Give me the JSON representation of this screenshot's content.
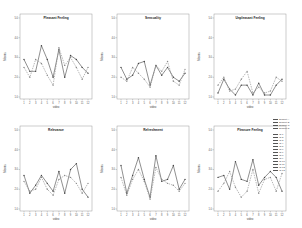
{
  "chart_data": [
    {
      "type": "line",
      "title": "Pleasant Feeling",
      "xlabel": "video",
      "ylabel": "Means",
      "ylim": [
        1.0,
        5.0
      ],
      "yticks": [
        "1.0",
        "2.0",
        "3.0",
        "4.0",
        "5.0"
      ],
      "x": [
        "1",
        "2",
        "3",
        "4",
        "5",
        "6",
        "7",
        "8",
        "9",
        "10",
        "11",
        "12"
      ],
      "series": [
        {
          "name": "Series A",
          "style": "solid",
          "values": [
            2.9,
            2.3,
            2.3,
            3.6,
            2.9,
            2.0,
            3.4,
            2.0,
            3.1,
            2.9,
            2.5,
            2.2
          ]
        },
        {
          "name": "Series B",
          "style": "dashed",
          "values": [
            2.5,
            2.0,
            2.9,
            2.7,
            2.1,
            1.6,
            3.5,
            2.6,
            3.0,
            2.5,
            1.9,
            2.5
          ]
        }
      ]
    },
    {
      "type": "line",
      "title": "Sensuality",
      "xlabel": "video",
      "ylabel": "Means",
      "ylim": [
        1.0,
        5.0
      ],
      "yticks": [
        "1.0",
        "2.0",
        "3.0",
        "4.0",
        "5.0"
      ],
      "x": [
        "1",
        "2",
        "3",
        "4",
        "5",
        "6",
        "7",
        "8",
        "9",
        "10",
        "11",
        "12"
      ],
      "series": [
        {
          "name": "Series A",
          "style": "solid",
          "values": [
            2.5,
            1.9,
            2.1,
            2.7,
            2.8,
            1.6,
            2.6,
            2.1,
            2.5,
            2.0,
            1.8,
            2.2
          ]
        },
        {
          "name": "Series B",
          "style": "dashed",
          "values": [
            2.0,
            1.8,
            2.5,
            2.2,
            1.9,
            1.5,
            2.6,
            2.3,
            2.8,
            1.8,
            1.6,
            2.4
          ]
        }
      ]
    },
    {
      "type": "line",
      "title": "Unpleasant Feeling",
      "xlabel": "video",
      "ylabel": "Means",
      "ylim": [
        1.0,
        5.0
      ],
      "yticks": [
        "1.0",
        "2.0",
        "3.0",
        "4.0",
        "5.0"
      ],
      "x": [
        "1",
        "2",
        "3",
        "4",
        "5",
        "6",
        "7",
        "8",
        "9",
        "10",
        "11",
        "12"
      ],
      "series": [
        {
          "name": "Series A",
          "style": "solid",
          "values": [
            1.2,
            1.9,
            1.4,
            1.1,
            1.6,
            1.6,
            1.1,
            1.7,
            1.1,
            1.1,
            1.6,
            1.9
          ]
        },
        {
          "name": "Series B",
          "style": "dashed",
          "values": [
            1.6,
            2.0,
            1.3,
            1.4,
            1.9,
            2.3,
            1.2,
            1.5,
            1.2,
            1.3,
            2.0,
            1.8
          ]
        }
      ]
    },
    {
      "type": "line",
      "title": "Relevance",
      "xlabel": "video",
      "ylabel": "Means",
      "ylim": [
        1.0,
        5.0
      ],
      "yticks": [
        "1.0",
        "2.0",
        "3.0",
        "4.0",
        "5.0"
      ],
      "x": [
        "1",
        "2",
        "3",
        "4",
        "5",
        "6",
        "7",
        "8",
        "9",
        "10",
        "11",
        "12"
      ],
      "series": [
        {
          "name": "Series A",
          "style": "solid",
          "values": [
            2.7,
            1.8,
            2.2,
            2.7,
            2.3,
            1.9,
            2.9,
            1.8,
            3.0,
            3.3,
            2.0,
            1.6
          ]
        },
        {
          "name": "Series B",
          "style": "dashed",
          "values": [
            2.4,
            1.9,
            2.0,
            2.6,
            2.0,
            1.7,
            2.5,
            2.7,
            2.6,
            2.3,
            1.8,
            2.3
          ]
        }
      ]
    },
    {
      "type": "line",
      "title": "Refreshment",
      "xlabel": "video",
      "ylabel": "Means",
      "ylim": [
        1.0,
        5.0
      ],
      "yticks": [
        "1.0",
        "2.0",
        "3.0",
        "4.0",
        "5.0"
      ],
      "x": [
        "1",
        "2",
        "3",
        "4",
        "5",
        "6",
        "7",
        "8",
        "9",
        "10",
        "11",
        "12"
      ],
      "series": [
        {
          "name": "Series A",
          "style": "solid",
          "values": [
            3.2,
            1.8,
            2.7,
            3.6,
            2.5,
            1.6,
            3.7,
            2.4,
            2.5,
            3.2,
            2.0,
            2.5
          ]
        },
        {
          "name": "Series B",
          "style": "dashed",
          "values": [
            2.6,
            1.7,
            2.5,
            3.0,
            2.4,
            1.5,
            3.1,
            2.5,
            2.3,
            2.2,
            1.9,
            2.3
          ]
        }
      ]
    },
    {
      "type": "line",
      "title": "Pleasure Feeling",
      "xlabel": "video",
      "ylabel": "Means",
      "ylim": [
        1.0,
        5.0
      ],
      "yticks": [
        "1.0",
        "2.0",
        "3.0",
        "4.0",
        "5.0"
      ],
      "x": [
        "1",
        "2",
        "3",
        "4",
        "5",
        "6",
        "7",
        "8",
        "9",
        "10",
        "11",
        "12"
      ],
      "series": [
        {
          "name": "Series A",
          "style": "solid",
          "values": [
            2.6,
            2.7,
            2.0,
            3.4,
            2.5,
            2.4,
            3.5,
            2.2,
            2.6,
            2.9,
            2.6,
            1.9
          ]
        },
        {
          "name": "Series B",
          "style": "dashed",
          "values": [
            1.9,
            2.3,
            2.9,
            2.1,
            1.6,
            1.9,
            3.0,
            1.8,
            2.5,
            2.6,
            1.9,
            2.8
          ]
        }
      ]
    }
  ],
  "legend": {
    "groups": [
      [
        "Subject A",
        "Subject B",
        "Subject C",
        "Subject D"
      ],
      [
        "ID 1",
        "ID 2",
        "ID 3",
        "ID 4",
        "ID 5",
        "ID 6",
        "ID 7",
        "ID 8",
        "ID 9",
        "ID 10",
        "ID 11",
        "ID 12",
        "ID 13"
      ]
    ]
  }
}
